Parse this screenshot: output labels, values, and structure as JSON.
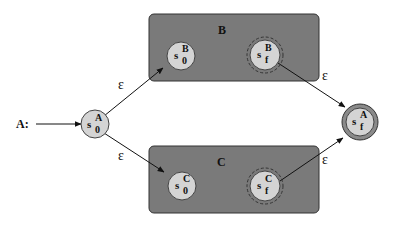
{
  "diagram": {
    "start_label": "A:",
    "colors": {
      "box_fill": "#7a7a7a",
      "box_stroke": "#333333",
      "state_fill": "#d4d4d4",
      "final_ring": "#8a8a8a",
      "line": "#111111"
    },
    "states": {
      "a_start": {
        "base": "s",
        "sup": "A",
        "sub": "0"
      },
      "a_final": {
        "base": "s",
        "sup": "A",
        "sub": "f"
      },
      "b_start": {
        "base": "s",
        "sup": "B",
        "sub": "0"
      },
      "b_final": {
        "base": "s",
        "sup": "B",
        "sub": "f"
      },
      "c_start": {
        "base": "s",
        "sup": "C",
        "sub": "0"
      },
      "c_final": {
        "base": "s",
        "sup": "C",
        "sub": "f"
      }
    },
    "boxes": {
      "b": {
        "label": "B"
      },
      "c": {
        "label": "C"
      }
    },
    "transitions": [
      {
        "from": "s_0^A",
        "to": "s_0^B",
        "label": "ε"
      },
      {
        "from": "s_0^A",
        "to": "s_0^C",
        "label": "ε"
      },
      {
        "from": "s_f^B",
        "to": "s_f^A",
        "label": "ε"
      },
      {
        "from": "s_f^C",
        "to": "s_f^A",
        "label": "ε"
      }
    ]
  }
}
